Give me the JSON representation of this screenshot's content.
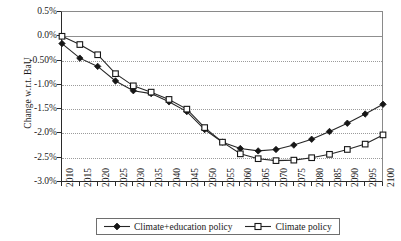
{
  "chart_data": {
    "type": "line",
    "title": "",
    "xlabel": "",
    "ylabel": "Change w.r.t. BaU",
    "ylim": [
      -3.0,
      0.5
    ],
    "yunit": "%",
    "grid": true,
    "legend_position": "bottom",
    "x": [
      2010,
      2015,
      2020,
      2025,
      2030,
      2035,
      2040,
      2045,
      2050,
      2055,
      2060,
      2065,
      2070,
      2075,
      2080,
      2085,
      2090,
      2095,
      2100
    ],
    "xticklabels": [
      "2010",
      "2015",
      "2020",
      "2025",
      "2030",
      "2035",
      "2040",
      "2045",
      "2050",
      "2055",
      "2060",
      "2065",
      "2070",
      "2075",
      "2080",
      "2085",
      "2090",
      "2095",
      "2100"
    ],
    "yticklabels": [
      "0.5%",
      "0.0%",
      "-0.50%",
      "-1.0%",
      "-1.5%",
      "-2.0%",
      "-2.5%",
      "-3.0%"
    ],
    "ytickvalues": [
      0.5,
      0.0,
      -0.5,
      -1.0,
      -1.5,
      -2.0,
      -2.5,
      -3.0
    ],
    "series": [
      {
        "name": "Climate+education policy",
        "marker": "filled-diamond",
        "values": [
          -0.15,
          -0.45,
          -0.62,
          -0.92,
          -1.12,
          -1.18,
          -1.35,
          -1.55,
          -1.92,
          -2.18,
          -2.31,
          -2.36,
          -2.33,
          -2.24,
          -2.12,
          -1.96,
          -1.79,
          -1.6,
          -1.4
        ]
      },
      {
        "name": "Climate policy",
        "marker": "open-square",
        "values": [
          0.0,
          -0.17,
          -0.38,
          -0.77,
          -1.02,
          -1.15,
          -1.3,
          -1.5,
          -1.88,
          -2.18,
          -2.42,
          -2.52,
          -2.56,
          -2.55,
          -2.5,
          -2.43,
          -2.33,
          -2.22,
          -2.03
        ]
      }
    ]
  },
  "legend": {
    "items": [
      {
        "label": "Climate+education policy",
        "marker": "filled-diamond"
      },
      {
        "label": "Climate policy",
        "marker": "open-square"
      }
    ]
  },
  "colors": {
    "series_line": "#262626",
    "marker_fill_a": "#161616",
    "marker_fill_b": "#ffffff",
    "grid": "#9b9b9b",
    "axis": "#2a2a2a",
    "background": "#ffffff"
  }
}
